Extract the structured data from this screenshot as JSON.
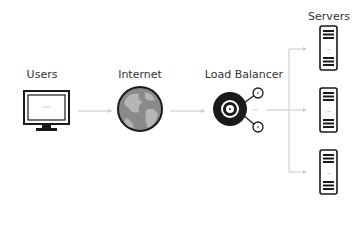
{
  "nodes": {
    "users": {
      "label": "Users",
      "icon": "monitor-icon"
    },
    "internet": {
      "label": "Internet",
      "icon": "globe-icon"
    },
    "load_balancer": {
      "label": "Load Balancer",
      "icon": "load-balancer-icon"
    },
    "servers": {
      "label": "Servers",
      "icon": "server-icon",
      "count": 3
    }
  },
  "edges": [
    {
      "from": "users",
      "to": "internet"
    },
    {
      "from": "internet",
      "to": "load_balancer"
    },
    {
      "from": "load_balancer",
      "to": "server-1"
    },
    {
      "from": "load_balancer",
      "to": "server-2"
    },
    {
      "from": "load_balancer",
      "to": "server-3"
    }
  ],
  "colors": {
    "stroke": "#1a1a1a",
    "arrow": "#c8c8c8",
    "globe_fill": "#888888",
    "globe_land": "#b5b5b5"
  }
}
